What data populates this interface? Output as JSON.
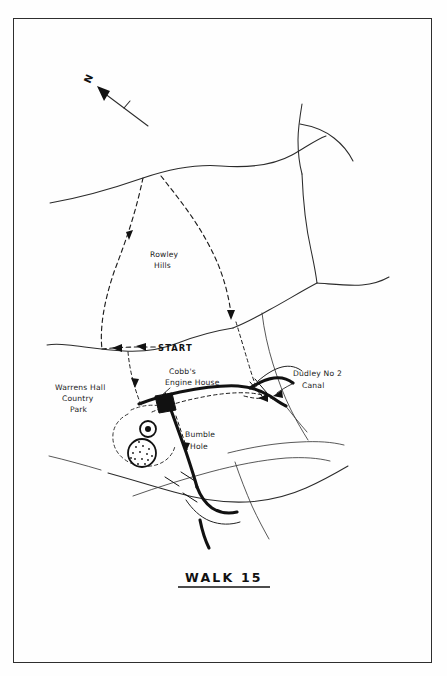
{
  "figure": {
    "kind": "hand-drawn-walking-route-map",
    "title": "WALK 15",
    "background_color": "#fefefe",
    "ink_color": "#111111",
    "frame": {
      "visible": true,
      "color": "#2e2e2e"
    }
  },
  "compass": {
    "label": "N",
    "direction": "up-left"
  },
  "labels": {
    "rowley_hills_line1": "Rowley",
    "rowley_hills_line2": "Hills",
    "start": "START",
    "cobbs_engine_house_line1": "Cobb's",
    "cobbs_engine_house_line2": "Engine House",
    "warrens_hall_line1": "Warrens Hall",
    "warrens_hall_line2": "Country",
    "warrens_hall_line3": "Park",
    "dudley_canal_line1": "Dudley No 2",
    "dudley_canal_line2": "Canal",
    "bumble_hole_line1": "Bumble",
    "bumble_hole_line2": "Hole"
  },
  "legend_features": {
    "route_style": "dashed line with direction arrows",
    "canal_style": "thick solid black line",
    "road_style": "thin solid line",
    "park_boundary_style": "fine dashed loop",
    "engine_house_marker": "filled black square",
    "pond_markers": "two circular pools, one stippled"
  },
  "colors": {
    "paper": "#fefefe",
    "ink": "#111111",
    "road": "#2b2b2b",
    "frame": "#2e2e2e"
  }
}
